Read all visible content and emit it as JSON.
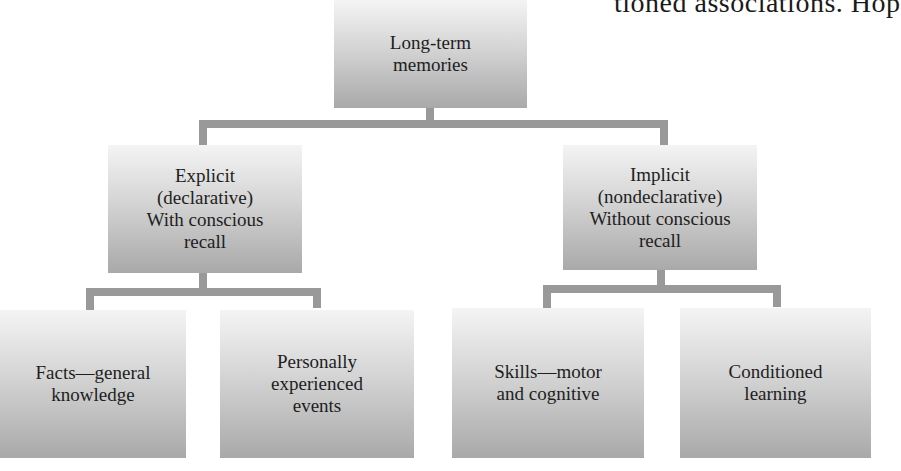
{
  "background_text": "tioned associations. Hop",
  "diagram": {
    "root": {
      "label": "Long-term\nmemories"
    },
    "branches": [
      {
        "label": "Explicit\n(declarative)\nWith conscious\nrecall",
        "children": [
          {
            "label": "Facts—general\nknowledge"
          },
          {
            "label": "Personally\nexperienced\nevents"
          }
        ]
      },
      {
        "label": "Implicit\n(nondeclarative)\nWithout conscious\nrecall",
        "children": [
          {
            "label": "Skills—motor\nand cognitive"
          },
          {
            "label": "Conditioned\nlearning"
          }
        ]
      }
    ]
  },
  "colors": {
    "connector": "#999999",
    "box_top": "#f4f4f4",
    "box_bottom": "#a9a9a9"
  }
}
